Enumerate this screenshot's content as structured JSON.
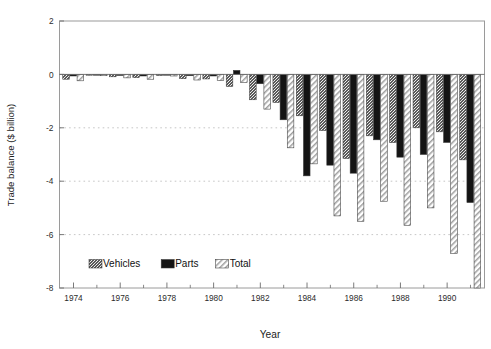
{
  "chart_data": {
    "type": "bar",
    "title": "",
    "xlabel": "Year",
    "ylabel": "Trade balance ($ billion)",
    "grid": "horizontal dotted gridlines at -2, -4, -6",
    "legend_position": "inside bottom-left",
    "xlim": [
      1973.4,
      1991.6
    ],
    "ylim": [
      -8,
      2
    ],
    "yticks": [
      2,
      0,
      -2,
      -4,
      -6,
      -8
    ],
    "ytick_labels": [
      "2",
      "0",
      "-2",
      "-4",
      "-6",
      "-8"
    ],
    "xticks_major": [
      1974,
      1976,
      1978,
      1980,
      1982,
      1984,
      1986,
      1988,
      1990
    ],
    "xtick_labels": [
      "1974",
      "1976",
      "1978",
      "1980",
      "1982",
      "1984",
      "1986",
      "1988",
      "1990"
    ],
    "xticks_minor": [
      1975,
      1977,
      1979,
      1981,
      1983,
      1985,
      1987,
      1989,
      1991
    ],
    "categories": [
      1974,
      1975,
      1976,
      1977,
      1978,
      1979,
      1980,
      1981,
      1982,
      1983,
      1984,
      1985,
      1986,
      1987,
      1988,
      1989,
      1990,
      1991
    ],
    "series": [
      {
        "name": "Vehicles",
        "pattern": "stipple-dark-gray",
        "color": "#4a4a4a",
        "values": [
          -0.18,
          -0.03,
          -0.09,
          -0.12,
          -0.04,
          -0.16,
          -0.17,
          -0.45,
          -0.95,
          -1.05,
          -1.55,
          -2.1,
          -3.15,
          -2.3,
          -2.55,
          -2.0,
          -2.15,
          -3.2
        ]
      },
      {
        "name": "Parts",
        "pattern": "solid-black",
        "color": "#111111",
        "values": [
          -0.06,
          -0.02,
          -0.04,
          -0.06,
          -0.02,
          -0.05,
          -0.06,
          0.15,
          -0.35,
          -1.7,
          -3.8,
          -3.4,
          -3.7,
          -2.45,
          -3.1,
          -3.0,
          -2.55,
          -4.8
        ]
      },
      {
        "name": "Total",
        "pattern": "diagonal-hatch",
        "color": "#e8e8e8",
        "values": [
          -0.24,
          -0.05,
          -0.13,
          -0.18,
          -0.06,
          -0.21,
          -0.23,
          -0.3,
          -1.3,
          -2.75,
          -3.35,
          -5.3,
          -5.5,
          -4.75,
          -5.65,
          -5.0,
          -6.7,
          -8.0
        ]
      }
    ]
  },
  "legend": {
    "items": [
      {
        "label": "Vehicles"
      },
      {
        "label": "Parts"
      },
      {
        "label": "Total"
      }
    ]
  },
  "axes": {
    "x_title": "Year",
    "y_title": "Trade balance ($ billion)"
  }
}
